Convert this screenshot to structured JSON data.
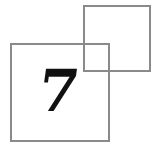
{
  "figure": {
    "digit": "7",
    "colors": {
      "outline": "#8a8a8a",
      "digit": "#111111",
      "background": "#ffffff"
    }
  }
}
